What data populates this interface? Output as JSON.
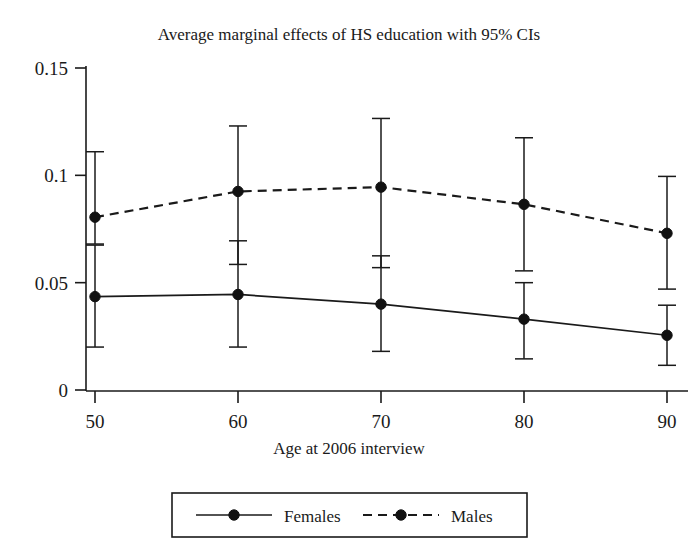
{
  "chart_data": {
    "type": "line",
    "title": "Average marginal effects of HS education with 95% CIs",
    "xlabel": "Age at 2006 interview",
    "ylabel": "",
    "x": [
      50,
      60,
      70,
      80,
      90
    ],
    "xticklabels": [
      "50",
      "60",
      "70",
      "80",
      "90"
    ],
    "yticklabels": [
      "0",
      "0.05",
      "0.1",
      "0.15"
    ],
    "yticks": [
      0,
      0.05,
      0.1,
      0.15
    ],
    "xlim": [
      45,
      95
    ],
    "ylim": [
      0,
      0.15
    ],
    "grid": false,
    "legend_position": "below-axis",
    "error_bars": "95% confidence intervals",
    "series": [
      {
        "name": "Females",
        "style": "solid",
        "marker": "filled-circle",
        "values": [
          0.0435,
          0.0445,
          0.04,
          0.033,
          0.0255
        ],
        "ci_low": [
          0.02,
          0.02,
          0.018,
          0.0145,
          0.0115
        ],
        "ci_high": [
          0.0675,
          0.0695,
          0.0625,
          0.05,
          0.0395
        ]
      },
      {
        "name": "Males",
        "style": "dashed",
        "marker": "filled-circle",
        "values": [
          0.0805,
          0.0925,
          0.0945,
          0.0865,
          0.073
        ],
        "ci_low": [
          0.068,
          0.0585,
          0.057,
          0.0555,
          0.047
        ],
        "ci_high": [
          0.111,
          0.123,
          0.1265,
          0.1175,
          0.0995
        ]
      }
    ]
  },
  "legend": {
    "items": [
      {
        "label": "Females",
        "style": "solid"
      },
      {
        "label": "Males",
        "style": "dashed"
      }
    ]
  }
}
